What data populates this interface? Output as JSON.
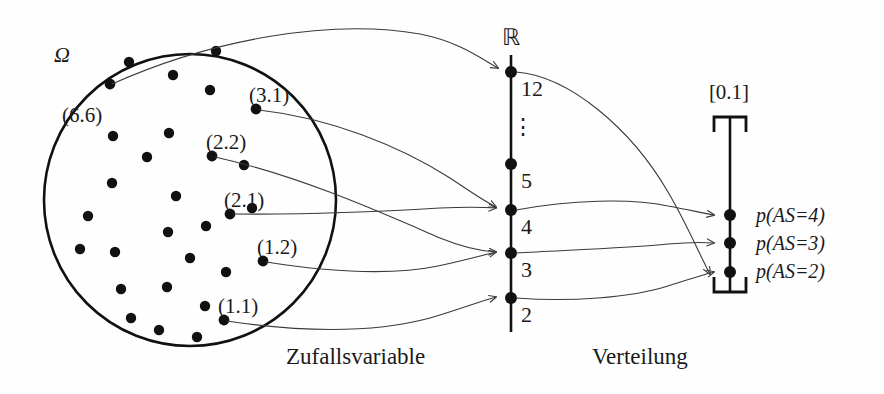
{
  "figure": {
    "type": "diagram",
    "captions": {
      "left": "Zufallsvariable",
      "right": "Verteilung"
    }
  },
  "sample_space": {
    "symbol": "Ω",
    "circle": {
      "cx": 190,
      "cy": 200,
      "r": 146
    },
    "labeled_outcomes": [
      {
        "id": "o66",
        "label": "(6.6)",
        "dot": [
          110,
          84
        ],
        "label_pos": [
          62,
          120
        ],
        "maps_to": "12"
      },
      {
        "id": "o31",
        "label": "(3.1)",
        "dot": [
          256,
          109
        ],
        "label_pos": [
          250,
          100
        ],
        "maps_to": "4"
      },
      {
        "id": "o22",
        "label": "(2.2)",
        "dot": [
          212,
          156
        ],
        "label_pos": [
          210,
          147
        ],
        "maps_to": "4"
      },
      {
        "id": "o21",
        "label": "(2.1)",
        "dot": [
          230,
          214
        ],
        "label_pos": [
          228,
          205
        ],
        "maps_to": "3"
      },
      {
        "id": "o12",
        "label": "(1.2)",
        "dot": [
          263,
          261
        ],
        "label_pos": [
          260,
          252
        ],
        "maps_to": "3"
      },
      {
        "id": "o11",
        "label": "(1.1)",
        "dot": [
          224,
          320
        ],
        "label_pos": [
          222,
          311
        ],
        "maps_to": "2"
      }
    ],
    "unlabeled_dots": [
      [
        129,
        62
      ],
      [
        173,
        75
      ],
      [
        216,
        51
      ],
      [
        210,
        90
      ],
      [
        93,
        106
      ],
      [
        145,
        132
      ],
      [
        134,
        164
      ],
      [
        116,
        183
      ],
      [
        76,
        250
      ],
      [
        155,
        191
      ],
      [
        102,
        135
      ],
      [
        117,
        222
      ],
      [
        170,
        230
      ],
      [
        121,
        252
      ],
      [
        98,
        290
      ],
      [
        153,
        259
      ],
      [
        118,
        318
      ],
      [
        109,
        214
      ],
      [
        187,
        289
      ],
      [
        159,
        330
      ],
      [
        196,
        339
      ],
      [
        143,
        307
      ],
      [
        81,
        216
      ],
      [
        205,
        266
      ]
    ]
  },
  "real_line": {
    "symbol": "ℝ",
    "symbol_pos": [
      511,
      38
    ],
    "x": 511,
    "top": 55,
    "bottom": 330,
    "ticks": [
      {
        "value": "12",
        "y": 72
      },
      {
        "value": "5",
        "y": 164
      },
      {
        "value": "4",
        "y": 210
      },
      {
        "value": "3",
        "y": 253
      },
      {
        "value": "2",
        "y": 298
      }
    ],
    "ellipsis": {
      "text": "⋮",
      "x": 523,
      "y": 126
    }
  },
  "unit_interval": {
    "label": "[0.1]",
    "label_pos": [
      728,
      92
    ],
    "x": 731,
    "top": 117,
    "bottom": 292,
    "bracket_width": 30,
    "points": [
      {
        "id": "p4",
        "label": "p(AS=4)",
        "y": 215,
        "from": "4"
      },
      {
        "id": "p3",
        "label": "p(AS=3)",
        "y": 243,
        "from": "3"
      },
      {
        "id": "p2",
        "label": "p(AS=2)",
        "y": 272,
        "from": "2"
      }
    ]
  },
  "colors": {
    "ink": "#111111",
    "thin_ink": "#3a3a3a",
    "background": "#fefefe"
  }
}
